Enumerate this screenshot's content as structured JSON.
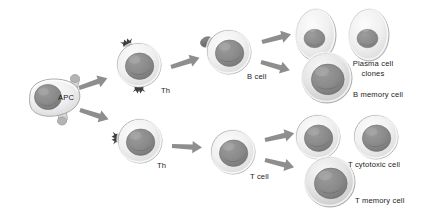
{
  "diagram": {
    "type": "biological-flow-diagram",
    "background_color": "#ffffff",
    "palette": {
      "cytoplasm_light": "#f2f2f2",
      "cytoplasm_mid": "#e2e2e2",
      "cytoplasm_shadow": "#c9c9c9",
      "nucleus": "#8c8c8c",
      "nucleus_dark": "#6f6f6f",
      "outline": "#9a9a9a",
      "arrow": "#8e8e8e",
      "receptor": "#4a4a4a",
      "antigen": "#707070",
      "text": "#1b1b1b"
    },
    "cells": [
      {
        "id": "apc",
        "label": "APC",
        "shape": "irregular-blob",
        "label_position": "inside-right",
        "x": 52,
        "y": 98,
        "features": [
          "pseudopod-top-right",
          "pseudopod-bottom"
        ]
      },
      {
        "id": "th-upper",
        "label": "Th",
        "shape": "round",
        "label_position": "bottom-right",
        "x": 139,
        "y": 65,
        "features": [
          "receptor-top-left",
          "receptor-bottom"
        ]
      },
      {
        "id": "th-lower",
        "label": "Th",
        "shape": "round",
        "label_position": "bottom-right",
        "x": 140,
        "y": 141,
        "features": [
          "receptor-left"
        ]
      },
      {
        "id": "b-cell",
        "label": "B cell",
        "shape": "round",
        "label_position": "bottom-right",
        "x": 229,
        "y": 52,
        "features": [
          "antigen-upper-left"
        ]
      },
      {
        "id": "t-cell",
        "label": "T cell",
        "shape": "round",
        "label_position": "bottom-right",
        "x": 233,
        "y": 152,
        "features": []
      },
      {
        "id": "plasma-cell-1",
        "label": "",
        "shape": "oval",
        "x": 316,
        "y": 35,
        "features": []
      },
      {
        "id": "plasma-cell-2",
        "label": "Plasma cell clones",
        "shape": "oval",
        "label_position": "below-right",
        "x": 369,
        "y": 35,
        "features": []
      },
      {
        "id": "b-memory-cell",
        "label": "B memory cell",
        "shape": "round-thick-rim",
        "label_position": "bottom-right",
        "x": 327,
        "y": 78,
        "features": []
      },
      {
        "id": "t-cytotoxic-1",
        "label": "",
        "shape": "round",
        "x": 318,
        "y": 137,
        "features": []
      },
      {
        "id": "t-cytotoxic-2",
        "label": "T cytotoxic cell",
        "shape": "round",
        "label_position": "below-right",
        "x": 376,
        "y": 137,
        "features": []
      },
      {
        "id": "t-memory-cell",
        "label": "T memory cell",
        "shape": "round-thick-rim",
        "label_position": "bottom-right",
        "x": 330,
        "y": 182,
        "features": []
      }
    ],
    "labels": {
      "apc": "APC",
      "th_upper": "Th",
      "th_lower": "Th",
      "b_cell": "B cell",
      "t_cell": "T cell",
      "plasma_cell_line1": "Plasma cell",
      "plasma_cell_line2": "clones",
      "b_memory_cell": "B memory cell",
      "t_cytotoxic_cell": "T cytotoxic cell",
      "t_memory_cell": "T memory cell"
    },
    "arrows": [
      {
        "id": "apc-to-th-upper",
        "from": "apc",
        "to": "th-upper",
        "direction": "up-right"
      },
      {
        "id": "apc-to-th-lower",
        "from": "apc",
        "to": "th-lower",
        "direction": "down-right"
      },
      {
        "id": "th-upper-to-b-cell",
        "from": "th-upper",
        "to": "b-cell",
        "direction": "up-right"
      },
      {
        "id": "th-lower-to-t-cell",
        "from": "th-lower",
        "to": "t-cell",
        "direction": "right"
      },
      {
        "id": "b-cell-to-plasma",
        "from": "b-cell",
        "to": "plasma-cell-1",
        "direction": "up-right"
      },
      {
        "id": "b-cell-to-b-memory",
        "from": "b-cell",
        "to": "b-memory-cell",
        "direction": "down-right"
      },
      {
        "id": "t-cell-to-t-cytotoxic",
        "from": "t-cell",
        "to": "t-cytotoxic-1",
        "direction": "up-right"
      },
      {
        "id": "t-cell-to-t-memory",
        "from": "t-cell",
        "to": "t-memory-cell",
        "direction": "down-right"
      }
    ]
  }
}
